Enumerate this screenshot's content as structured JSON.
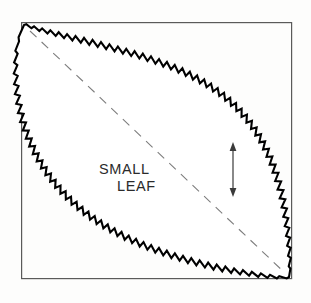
{
  "figure": {
    "background_color": "#fdfdfc",
    "frame": {
      "name": "figure-border",
      "color": "#5a5a5a",
      "x": 21,
      "y": 22,
      "width": 271,
      "height": 257,
      "stroke_width": 1.2
    },
    "labels": {
      "line1": "SMALL",
      "line2": "LEAF"
    },
    "label_color": "#2b2b2b",
    "leaf": {
      "name": "serrated-leaf-outline",
      "outline_color": "#000000",
      "fill_color": "#ffffff",
      "margin_type": "serrate",
      "orientation": "diagonal-top-left-to-bottom-right",
      "tip_start": [
        24,
        25
      ],
      "tip_end": [
        289,
        277
      ],
      "serration_count": 96
    },
    "midrib": {
      "name": "midrib-dashed-line",
      "color": "#7d7d7d",
      "dash_pattern": "9 7",
      "stroke_width": 1.1,
      "from": [
        30,
        31
      ],
      "to": [
        285,
        273
      ]
    },
    "measure_arrow": {
      "name": "width-measure-arrow",
      "color": "#3a3a3a",
      "x": 233,
      "y_top": 143,
      "y_bottom": 196,
      "double_headed": true,
      "stroke_width": 1.2
    }
  }
}
